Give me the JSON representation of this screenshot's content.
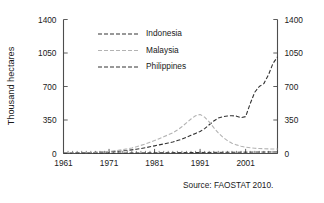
{
  "chart_data": {
    "type": "line",
    "title": "",
    "xlabel": "",
    "ylabel": "Thousand hectares",
    "xlim": [
      1961,
      2008
    ],
    "ylim": [
      0,
      1400
    ],
    "yticks": [
      0,
      350,
      700,
      1050,
      1400
    ],
    "yticklabels": [
      "0",
      "350",
      "700",
      "1050",
      "1400"
    ],
    "xticks": [
      1961,
      1971,
      1981,
      1991,
      2001
    ],
    "xticklabels": [
      "1961",
      "1971",
      "1981",
      "1991",
      "2001"
    ],
    "minor_xtick_step": 1,
    "grid": false,
    "right_axis": true,
    "right_yticklabels": [
      "0",
      "350",
      "700",
      "1050",
      "1400"
    ],
    "legend_position": "upper-left-inside",
    "annotation": "Source: FAOSTAT 2010.",
    "x": [
      1961,
      1962,
      1963,
      1964,
      1965,
      1966,
      1967,
      1968,
      1969,
      1970,
      1971,
      1972,
      1973,
      1974,
      1975,
      1976,
      1977,
      1978,
      1979,
      1980,
      1981,
      1982,
      1983,
      1984,
      1985,
      1986,
      1987,
      1988,
      1989,
      1990,
      1991,
      1992,
      1993,
      1994,
      1995,
      1996,
      1997,
      1998,
      1999,
      2000,
      2001,
      2002,
      2003,
      2004,
      2005,
      2006,
      2007,
      2008
    ],
    "series": [
      {
        "name": "Indonesia",
        "color": "#333333",
        "dash": "4 2",
        "width": 1.1,
        "values": [
          4,
          5,
          6,
          7,
          8,
          9,
          10,
          12,
          14,
          16,
          18,
          21,
          24,
          28,
          32,
          38,
          45,
          52,
          60,
          70,
          80,
          90,
          100,
          110,
          120,
          135,
          150,
          170,
          190,
          210,
          230,
          260,
          300,
          340,
          370,
          385,
          392,
          395,
          390,
          375,
          385,
          520,
          640,
          700,
          730,
          820,
          940,
          1010
        ]
      },
      {
        "name": "Malaysia",
        "color": "#b3b3b3",
        "dash": "4 2",
        "width": 1.1,
        "values": [
          2,
          3,
          4,
          5,
          6,
          7,
          9,
          11,
          14,
          18,
          22,
          27,
          33,
          40,
          48,
          58,
          70,
          85,
          100,
          118,
          135,
          155,
          175,
          195,
          215,
          245,
          280,
          320,
          360,
          395,
          408,
          380,
          330,
          270,
          215,
          170,
          135,
          108,
          90,
          76,
          66,
          60,
          55,
          52,
          50,
          48,
          47,
          46
        ]
      },
      {
        "name": "Philippines",
        "color": "#333333",
        "dash": "4 2",
        "width": 1.0,
        "values": [
          1,
          1,
          1,
          2,
          2,
          2,
          3,
          3,
          3,
          4,
          4,
          4,
          5,
          5,
          5,
          6,
          6,
          6,
          7,
          7,
          7,
          8,
          8,
          8,
          9,
          9,
          9,
          10,
          10,
          10,
          11,
          11,
          11,
          12,
          12,
          12,
          13,
          13,
          13,
          14,
          14,
          14,
          15,
          15,
          15,
          16,
          16,
          16
        ]
      }
    ]
  },
  "axes": {
    "y_axis_title": "Thousand hectares"
  },
  "legend": {
    "items": [
      {
        "label": "Indonesia"
      },
      {
        "label": "Malaysia"
      },
      {
        "label": "Philippines"
      }
    ]
  },
  "footer": {
    "source": "Source: FAOSTAT 2010."
  }
}
